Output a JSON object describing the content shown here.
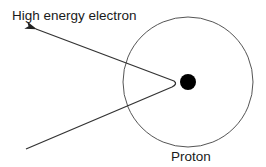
{
  "diagram": {
    "labels": {
      "electron": "High energy electron",
      "proton": "Proton"
    },
    "colors": {
      "line": "#333333",
      "circle": "#555555",
      "core": "#000000",
      "text": "#1a1a1a",
      "background": "#ffffff"
    },
    "elements": [
      {
        "name": "proton-boundary",
        "shape": "circle",
        "cx": 188,
        "cy": 82,
        "r": 65
      },
      {
        "name": "proton-core",
        "shape": "filled-circle",
        "cx": 188,
        "cy": 82,
        "r": 8
      },
      {
        "name": "incoming-electron-path",
        "shape": "line",
        "from": [
          26,
          149
        ],
        "to": [
          176,
          85
        ]
      },
      {
        "name": "outgoing-electron-path",
        "shape": "arrow",
        "from": [
          176,
          85
        ],
        "to": [
          34,
          28
        ]
      }
    ]
  }
}
